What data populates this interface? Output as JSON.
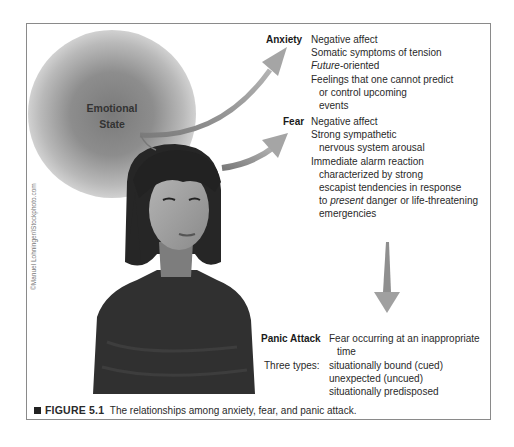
{
  "figure": {
    "emotional_state": [
      "Emotional",
      "State"
    ],
    "anxiety": {
      "label": "Anxiety",
      "lines": [
        {
          "text": "Negative affect",
          "indent": false
        },
        {
          "text": "Somatic symptoms of tension",
          "indent": false
        },
        {
          "italic": "Future",
          "text": "-oriented",
          "indent": false
        },
        {
          "text": "Feelings that one cannot predict",
          "indent": false
        },
        {
          "text": "or control upcoming",
          "indent": true
        },
        {
          "text": "events",
          "indent": true
        }
      ]
    },
    "fear": {
      "label": "Fear",
      "lines": [
        {
          "text": "Negative affect",
          "indent": false
        },
        {
          "text": "Strong sympathetic",
          "indent": false
        },
        {
          "text": "nervous system arousal",
          "indent": true
        },
        {
          "text": "Immediate alarm reaction",
          "indent": false
        },
        {
          "text": "characterized by strong",
          "indent": true
        },
        {
          "text": "escapist tendencies in response",
          "indent": true
        },
        {
          "pre": "to ",
          "italic": "present",
          "text": " danger or life-threatening",
          "indent": true
        },
        {
          "text": "emergencies",
          "indent": true
        }
      ]
    },
    "panic_attack": {
      "label": "Panic Attack",
      "definition": [
        "Fear occurring at an inappropriate",
        "time"
      ],
      "types_label": "Three types:",
      "types": [
        "situationally bound (cued)",
        "unexpected (uncued)",
        "situationally predisposed"
      ]
    },
    "photo_credit": "©Manuel Lohninger/iStockphoto.com",
    "caption": {
      "number": "FIGURE 5.1",
      "text": "The relationships among anxiety, fear, and panic attack."
    },
    "colors": {
      "arrow": "#9a9a9a",
      "frame": "#8a8a8a"
    }
  }
}
